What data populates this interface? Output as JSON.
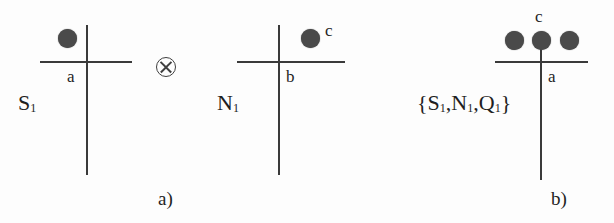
{
  "figure": {
    "caption_a": "a)",
    "caption_b": "b)",
    "operator_symbol": "⊗",
    "stroke_color": "#3a3a3a",
    "dot_color": "#4a4a4a",
    "background_color": "#fdfdfd"
  },
  "diagram_1": {
    "name_label": "S",
    "name_subscript": "1",
    "edge_label_a": "a",
    "dots": [
      {
        "id": "dot-upper-left"
      }
    ]
  },
  "diagram_2": {
    "name_label": "N",
    "name_subscript": "1",
    "edge_label_b": "b",
    "edge_label_c": "c",
    "dots": [
      {
        "id": "dot-upper-right"
      }
    ]
  },
  "diagram_3": {
    "set_open": "{",
    "set_item_1": "S",
    "set_item_1_sub": "1",
    "set_sep_1": ",",
    "set_item_2": "N",
    "set_item_2_sub": "1",
    "set_sep_2": ",",
    "set_item_3": "Q",
    "set_item_3_sub": "1",
    "set_close": "}",
    "edge_label_a": "a",
    "edge_label_c": "c",
    "dots": [
      {
        "id": "dot-left"
      },
      {
        "id": "dot-center"
      },
      {
        "id": "dot-right"
      }
    ]
  }
}
